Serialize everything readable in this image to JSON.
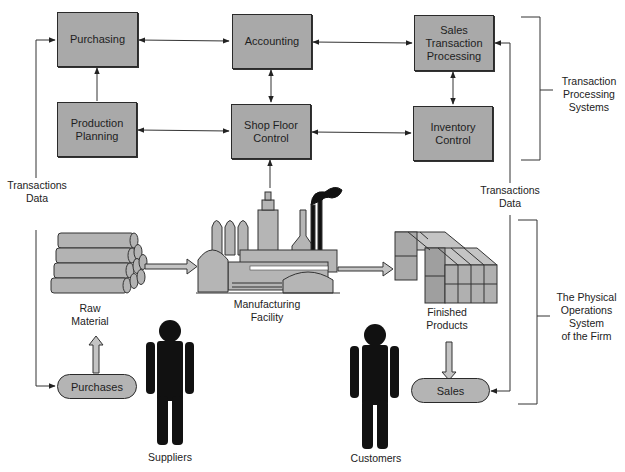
{
  "tps_boxes": {
    "purchasing": "Purchasing",
    "accounting": "Accounting",
    "sales_transaction_processing": "Sales\nTransaction\nProcessing",
    "production_planning": "Production\nPlanning",
    "shop_floor_control": "Shop Floor\nControl",
    "inventory_control": "Inventory\nControl"
  },
  "physical": {
    "raw_material": "Raw\nMaterial",
    "manufacturing_facility": "Manufacturing\nFacility",
    "finished_products": "Finished\nProducts",
    "purchases": "Purchases",
    "sales": "Sales",
    "suppliers": "Suppliers",
    "customers": "Customers"
  },
  "flows": {
    "left_transactions_data": "Transactions\nData",
    "right_transactions_data": "Transactions\nData"
  },
  "brackets": {
    "tps": "Transaction\nProcessing\nSystems",
    "physical": "The Physical\nOperations\nSystem\nof the Firm"
  },
  "colors": {
    "box_fill": "#a9a9a9",
    "outline": "#2a2a2a",
    "figure": "#111111"
  }
}
